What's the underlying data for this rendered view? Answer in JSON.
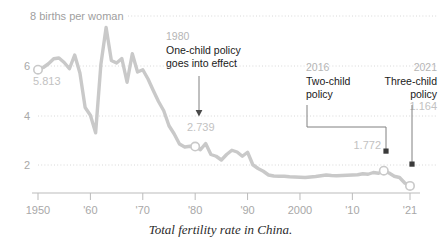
{
  "caption": "Total fertility rate in China.",
  "axis": {
    "y_unit_label": "8 births per woman",
    "y_ticks": [
      {
        "value": 8,
        "label": "8 births per woman"
      },
      {
        "value": 6,
        "label": "6"
      },
      {
        "value": 4,
        "label": "4"
      },
      {
        "value": 2,
        "label": "2"
      }
    ],
    "x_ticks": [
      {
        "value": 1950,
        "label": "1950"
      },
      {
        "value": 1960,
        "label": "'60"
      },
      {
        "value": 1970,
        "label": "'70"
      },
      {
        "value": 1980,
        "label": "'80"
      },
      {
        "value": 1990,
        "label": "'90"
      },
      {
        "value": 2000,
        "label": "2000"
      },
      {
        "value": 2010,
        "label": "'10"
      },
      {
        "value": 2021,
        "label": "'21"
      }
    ]
  },
  "annotations": [
    {
      "id": "one-child",
      "year": "1980",
      "line1": "One-child policy",
      "line2": "goes into effect",
      "value_label": "2.739"
    },
    {
      "id": "two-child",
      "year": "2016",
      "line1": "Two-child",
      "line2": "policy",
      "value_label": "1.772"
    },
    {
      "id": "three-child",
      "year": "2021",
      "line1": "Three-child",
      "line2": "policy",
      "value_label": "1.164"
    }
  ],
  "point_labels": {
    "start": "5.813",
    "one_child": "2.739",
    "two_child": "1.772",
    "three_child": "1.164"
  },
  "colors": {
    "line": "#c9c9c9",
    "grid": "#d8d8d8",
    "axis": "#bbbbbb",
    "text_dark": "#1a1a1a",
    "text_muted": "#b5b5b5",
    "marker_fill": "#ffffff"
  },
  "chart_data": {
    "type": "line",
    "title": "",
    "subtitle": "",
    "xlabel": "",
    "ylabel": "births per woman",
    "xlim": [
      1950,
      2021
    ],
    "ylim": [
      0.8,
      8.2
    ],
    "grid": "horizontal-dotted",
    "legend": "none",
    "series": [
      {
        "name": "Total fertility rate in China",
        "x": [
          1950,
          1951,
          1952,
          1953,
          1954,
          1955,
          1956,
          1957,
          1958,
          1959,
          1960,
          1961,
          1962,
          1963,
          1964,
          1965,
          1966,
          1967,
          1968,
          1969,
          1970,
          1971,
          1972,
          1973,
          1974,
          1975,
          1976,
          1977,
          1978,
          1979,
          1980,
          1981,
          1982,
          1983,
          1984,
          1985,
          1986,
          1987,
          1988,
          1989,
          1990,
          1991,
          1992,
          1993,
          1994,
          1995,
          1996,
          1997,
          1998,
          1999,
          2000,
          2001,
          2002,
          2003,
          2004,
          2005,
          2006,
          2007,
          2008,
          2009,
          2010,
          2011,
          2012,
          2013,
          2014,
          2015,
          2016,
          2017,
          2018,
          2019,
          2020,
          2021
        ],
        "y": [
          5.813,
          5.9,
          6.05,
          6.25,
          6.28,
          6.1,
          5.85,
          6.4,
          5.68,
          4.3,
          3.99,
          3.29,
          6.02,
          7.5,
          6.18,
          6.08,
          6.26,
          5.31,
          6.45,
          5.72,
          5.81,
          5.44,
          4.98,
          4.54,
          4.17,
          3.57,
          3.24,
          2.84,
          2.72,
          2.75,
          2.739,
          2.61,
          2.86,
          2.42,
          2.35,
          2.2,
          2.42,
          2.59,
          2.52,
          2.35,
          2.51,
          2.01,
          1.86,
          1.75,
          1.6,
          1.56,
          1.55,
          1.55,
          1.53,
          1.52,
          1.51,
          1.5,
          1.52,
          1.54,
          1.57,
          1.6,
          1.58,
          1.57,
          1.58,
          1.59,
          1.6,
          1.61,
          1.65,
          1.63,
          1.7,
          1.67,
          1.772,
          1.68,
          1.55,
          1.5,
          1.28,
          1.164
        ]
      }
    ],
    "markers": [
      {
        "x": 1950,
        "y": 5.813,
        "label": "5.813"
      },
      {
        "x": 1980,
        "y": 2.739,
        "label": "2.739"
      },
      {
        "x": 2016,
        "y": 1.772,
        "label": "1.772"
      },
      {
        "x": 2021,
        "y": 1.164,
        "label": "1.164"
      }
    ]
  }
}
